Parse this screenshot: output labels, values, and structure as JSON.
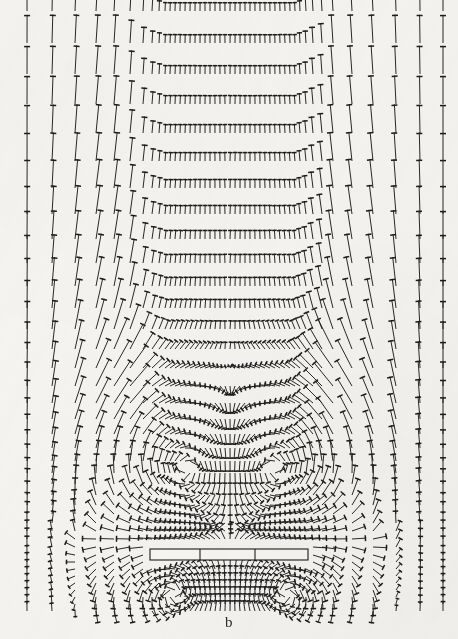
{
  "figure": {
    "panel_label": "b",
    "kind": "vector-field",
    "background_color": "#f6f4f1",
    "ink_color": "#1c1c1c",
    "width": 458,
    "height": 639
  },
  "body": {
    "name": "rectangular-obstacle",
    "x0": 150,
    "x1": 308,
    "y0": 549,
    "y1": 560,
    "divider_x": [
      200,
      255
    ],
    "stroke": "#1c1c1c"
  },
  "chart_data": {
    "type": "quiver",
    "title": "",
    "subtitle": "",
    "xlabel": "",
    "ylabel": "",
    "legend": [],
    "grid": false,
    "annotations": [
      "b"
    ],
    "xlim": [
      0,
      458
    ],
    "ylim": [
      0,
      639
    ],
    "grid_columns_x": [
      27,
      52,
      75,
      96,
      114,
      130,
      143,
      152,
      159,
      165,
      170,
      175,
      180,
      185,
      190,
      195,
      200,
      205,
      210,
      215,
      220,
      225,
      230,
      235,
      240,
      245,
      250,
      255,
      260,
      265,
      270,
      275,
      280,
      285,
      290,
      295,
      300,
      306,
      313,
      322,
      333,
      352,
      373,
      396,
      420,
      443
    ],
    "grid_rows_y": [
      11,
      43,
      74,
      104,
      133,
      161,
      188,
      214,
      239,
      263,
      286,
      308,
      329,
      349,
      368,
      386,
      403,
      419,
      434,
      448,
      461,
      473,
      484,
      495,
      505,
      514,
      523,
      531,
      539,
      547,
      555,
      562,
      569,
      576,
      583,
      590,
      597,
      604,
      611
    ],
    "flow": {
      "freestream_direction_deg": 90,
      "freestream_speed": 1.0,
      "obstacle": {
        "x0": 150,
        "x1": 308,
        "y0": 549,
        "y1": 560
      },
      "vortex_centers": [
        {
          "x": 188,
          "y": 470,
          "sense": "ccw"
        },
        {
          "x": 272,
          "y": 470,
          "sense": "cw"
        },
        {
          "x": 175,
          "y": 592,
          "sense": "cw"
        },
        {
          "x": 285,
          "y": 592,
          "sense": "ccw"
        }
      ]
    }
  }
}
